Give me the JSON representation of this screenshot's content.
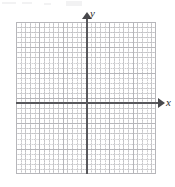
{
  "figure": {
    "kind": "cartesian-coordinate-grid"
  },
  "axes": {
    "x_label": "x",
    "y_label": "y",
    "x_arrow_direction": "right",
    "y_arrow_direction": "up",
    "axis_color": "#58585c",
    "arrow_color": "#48484c",
    "label_color": "#2e2e31"
  },
  "grid": {
    "major_color": "#b6b6ba",
    "minor_color": "#96969b",
    "background_color": "#ffffff",
    "major_columns": 6,
    "major_rows": 6,
    "minor_subdivisions_per_major": 5,
    "show_tick_labels": false
  },
  "chart_data": {
    "type": "scatter",
    "title": "",
    "subtitle": "",
    "xlabel": "x",
    "ylabel": "y",
    "xlim": [
      -3,
      3
    ],
    "ylim": [
      -3,
      3
    ],
    "xticks": [
      -3,
      -2,
      -1,
      0,
      1,
      2,
      3
    ],
    "yticks": [
      -3,
      -2,
      -1,
      0,
      1,
      2,
      3
    ],
    "xticklabels": [
      "",
      "",
      "",
      "",
      "",
      "",
      ""
    ],
    "yticklabels": [
      "",
      "",
      "",
      "",
      "",
      "",
      ""
    ],
    "grid": true,
    "minor_grid": true,
    "legend": false,
    "legend_position": "none",
    "annotations": [],
    "series": [
      {
        "name": "",
        "x": [],
        "y": []
      }
    ]
  }
}
